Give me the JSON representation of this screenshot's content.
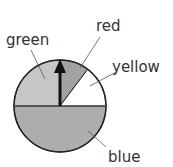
{
  "diagram": {
    "type": "spinner",
    "center": [
      60,
      106
    ],
    "radius": 46,
    "segments": [
      {
        "label": "green",
        "start_deg": 270,
        "end_deg": 360,
        "fill": "#c6c6c6"
      },
      {
        "label": "red",
        "start_deg": 0,
        "end_deg": 37,
        "fill": "#a2a2a2"
      },
      {
        "label": "yellow",
        "start_deg": 37,
        "end_deg": 90,
        "fill": "#ffffff"
      },
      {
        "label": "blue",
        "start_deg": 90,
        "end_deg": 270,
        "fill": "#adadad"
      }
    ],
    "pointer": {
      "direction": "up",
      "color": "#111111"
    },
    "labels": {
      "green": "green",
      "red": "red",
      "yellow": "yellow",
      "blue": "blue"
    }
  }
}
